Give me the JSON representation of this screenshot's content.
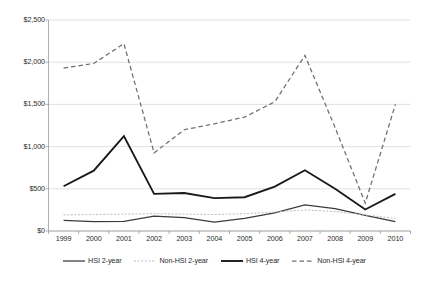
{
  "chart_data": {
    "type": "line",
    "title": "",
    "subtitle": "",
    "xlabel": "",
    "ylabel": "",
    "categories": [
      "1999",
      "2000",
      "2001",
      "2002",
      "2003",
      "2004",
      "2005",
      "2006",
      "2007",
      "2008",
      "2009",
      "2010"
    ],
    "ylim": [
      0,
      2500
    ],
    "ytick_values": [
      0,
      500,
      1000,
      1500,
      2000,
      2500
    ],
    "ytick_labels": [
      "$0",
      "$500",
      "$1,000",
      "$1,500",
      "$2,000",
      "$2,500"
    ],
    "grid": "horizontal",
    "legend_position": "bottom",
    "series": [
      {
        "name": "HSI 2-year",
        "style": "solid-thin",
        "color": "#3b3b3b",
        "values": [
          125,
          112,
          115,
          175,
          158,
          105,
          150,
          215,
          310,
          265,
          185,
          110
        ]
      },
      {
        "name": "Non-HSI 2-year",
        "style": "dotted-light",
        "color": "#bdbdbd",
        "values": [
          190,
          195,
          200,
          205,
          200,
          195,
          205,
          225,
          250,
          230,
          190,
          150
        ]
      },
      {
        "name": "HSI 4-year",
        "style": "solid-thick",
        "color": "#1a1a1a",
        "values": [
          530,
          715,
          1125,
          440,
          450,
          390,
          400,
          525,
          720,
          500,
          255,
          440
        ]
      },
      {
        "name": "Non-HSI 4-year",
        "style": "dashed",
        "color": "#6e6e6e",
        "values": [
          1930,
          1985,
          2220,
          925,
          1200,
          1270,
          1350,
          1530,
          2080,
          1225,
          330,
          1500
        ]
      }
    ]
  },
  "legend": {
    "items": [
      {
        "label": "HSI 2-year",
        "icon": "solid-thin-line-icon"
      },
      {
        "label": "Non-HSI 2-year",
        "icon": "dotted-light-line-icon"
      },
      {
        "label": "HSI 4-year",
        "icon": "solid-thick-line-icon"
      },
      {
        "label": "Non-HSI 4-year",
        "icon": "dashed-line-icon"
      }
    ]
  },
  "axes": {
    "y_labels": [
      "$2,500",
      "$2,000",
      "$1,500",
      "$1,000",
      "$500",
      "$0"
    ],
    "x_labels": [
      "1999",
      "2000",
      "2001",
      "2002",
      "2003",
      "2004",
      "2005",
      "2006",
      "2007",
      "2008",
      "2009",
      "2010"
    ]
  },
  "colors": {
    "grid": "#d9d9d9",
    "axis": "#9a9a9a",
    "text": "#2b2b2b",
    "series_hsi_2yr": "#3b3b3b",
    "series_nonhsi_2yr": "#bdbdbd",
    "series_hsi_4yr": "#1a1a1a",
    "series_nonhsi_4yr": "#6e6e6e"
  }
}
